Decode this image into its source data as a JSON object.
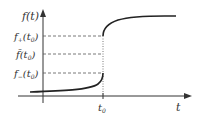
{
  "diagram": {
    "axes": {
      "y_label": "f(t)",
      "x_label": "t",
      "x_tick": "t0"
    },
    "levels": [
      {
        "label_main": "f",
        "label_sub": "+",
        "label_arg": "(t",
        "label_arg_sub": "0",
        "label_close": ")",
        "name": "f-plus"
      },
      {
        "label_main": "f̄",
        "label_sub": "",
        "label_arg": "(t",
        "label_arg_sub": "0",
        "label_close": ")",
        "name": "f-bar"
      },
      {
        "label_main": "f",
        "label_sub": "−",
        "label_arg": "(t",
        "label_arg_sub": "0",
        "label_close": ")",
        "name": "f-minus"
      }
    ],
    "colors": {
      "axis": "#333333",
      "curve": "#222222",
      "dashed": "#555555"
    }
  }
}
